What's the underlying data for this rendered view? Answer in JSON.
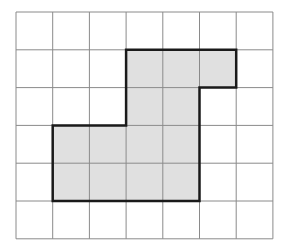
{
  "grid": {
    "cols": 7,
    "rows": 6,
    "origin_x": 16,
    "origin_y": 12,
    "cell_w": 36.7,
    "cell_h": 37.8,
    "line_color": "#8a8a8a",
    "background": "#ffffff"
  },
  "shape": {
    "fill": "#e0e0e0",
    "stroke": "#1a1a1a",
    "stroke_width": 2.5,
    "shaded_cells": [
      [
        1,
        3
      ],
      [
        1,
        4
      ],
      [
        1,
        5
      ],
      [
        2,
        3
      ],
      [
        2,
        4
      ],
      [
        3,
        1
      ],
      [
        3,
        2
      ],
      [
        3,
        3
      ],
      [
        3,
        4
      ],
      [
        4,
        1
      ],
      [
        4,
        2
      ],
      [
        4,
        3
      ],
      [
        4,
        4
      ]
    ],
    "outline_vertices": [
      [
        3,
        1
      ],
      [
        6,
        1
      ],
      [
        6,
        2
      ],
      [
        5,
        2
      ],
      [
        5,
        5
      ],
      [
        1,
        5
      ],
      [
        1,
        3
      ],
      [
        3,
        3
      ]
    ],
    "shaded_cell_count": 13
  }
}
